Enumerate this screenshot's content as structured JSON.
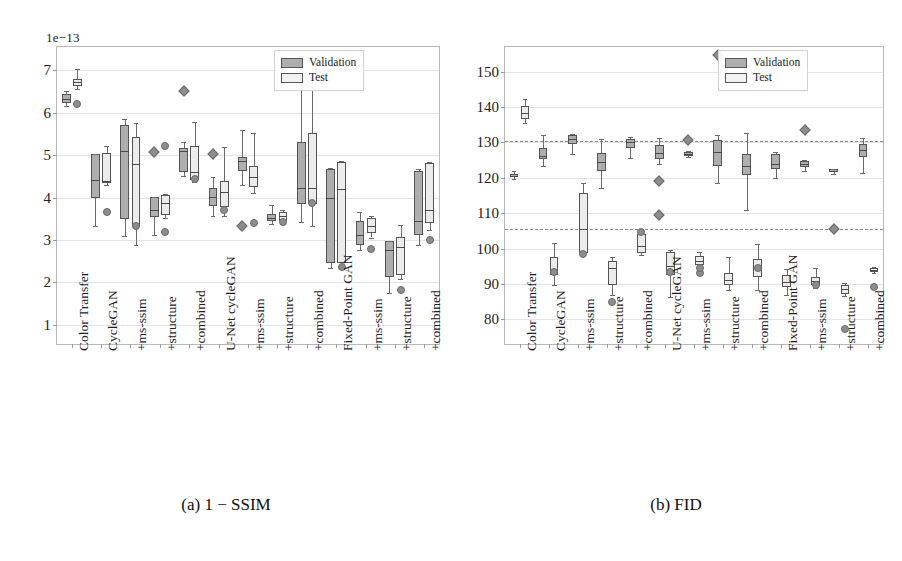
{
  "figure": {
    "panels": [
      {
        "id": "panel-a",
        "caption": "(a) 1 − SSIM",
        "exponent_label": "1e−13",
        "legend": {
          "validation": "Validation",
          "test": "Test"
        }
      },
      {
        "id": "panel-b",
        "caption": "(b) FID",
        "exponent_label": "",
        "legend": {
          "validation": "Validation",
          "test": "Test"
        }
      }
    ]
  },
  "chart_data": [
    {
      "type": "box",
      "title": "(a) 1 − SSIM",
      "xlabel": "",
      "ylabel": "",
      "ylim": [
        0.55,
        7.55
      ],
      "yticks": [
        1,
        2,
        3,
        4,
        5,
        6,
        7
      ],
      "exponent": "1e−13",
      "grid": true,
      "legend_position": "top-right",
      "legend": [
        "Validation",
        "Test"
      ],
      "categories": [
        "Color Transfer",
        "CycleGAN",
        "+ms-ssim",
        "+structure",
        "+combined",
        "U-Net cycleGAN",
        "+ms-ssim",
        "+structure",
        "+combined",
        "Fixed-Point GAN",
        "+ms-ssim",
        "+structure",
        "+combined"
      ],
      "series": [
        {
          "name": "Validation",
          "color": "#aeaeae",
          "boxes": [
            {
              "whislo": 6.16,
              "q1": 6.24,
              "med": 6.32,
              "q3": 6.45,
              "whishi": 6.52,
              "fliers": []
            },
            {
              "whislo": 3.33,
              "q1": 4.0,
              "med": 4.42,
              "q3": 5.03,
              "whishi": 5.03,
              "fliers": []
            },
            {
              "whislo": 3.1,
              "q1": 3.5,
              "med": 5.1,
              "q3": 5.7,
              "whishi": 5.86,
              "fliers": []
            },
            {
              "whislo": 3.13,
              "q1": 3.55,
              "med": 3.72,
              "q3": 4.02,
              "whishi": 4.02,
              "fliers": [
                5.08
              ]
            },
            {
              "whislo": 4.52,
              "q1": 4.6,
              "med": 5.1,
              "q3": 5.18,
              "whishi": 5.3,
              "fliers": [
                6.52
              ]
            },
            {
              "whislo": 3.56,
              "q1": 3.8,
              "med": 4.02,
              "q3": 4.22,
              "whishi": 4.48,
              "fliers": [
                5.02
              ]
            },
            {
              "whislo": 4.3,
              "q1": 4.62,
              "med": 4.86,
              "q3": 4.96,
              "whishi": 5.6,
              "fliers": [
                3.34
              ]
            },
            {
              "whislo": 3.37,
              "q1": 3.44,
              "med": 3.52,
              "q3": 3.62,
              "whishi": 3.82,
              "fliers": []
            },
            {
              "whislo": 3.42,
              "q1": 3.86,
              "med": 4.22,
              "q3": 5.3,
              "whishi": 7.34,
              "fliers": []
            },
            {
              "whislo": 2.34,
              "q1": 2.46,
              "med": 4.0,
              "q3": 4.68,
              "whishi": 4.7,
              "fliers": []
            },
            {
              "whislo": 2.76,
              "q1": 2.88,
              "med": 3.12,
              "q3": 3.46,
              "whishi": 3.66,
              "fliers": []
            },
            {
              "whislo": 1.76,
              "q1": 2.14,
              "med": 2.76,
              "q3": 2.98,
              "whishi": 2.98,
              "fliers": []
            },
            {
              "whislo": 2.88,
              "q1": 3.12,
              "med": 3.46,
              "q3": 4.62,
              "whishi": 4.68,
              "fliers": []
            }
          ]
        },
        {
          "name": "Test",
          "color": "#ececec",
          "boxes": [
            {
              "whislo": 6.56,
              "q1": 6.62,
              "med": 6.72,
              "q3": 6.8,
              "whishi": 7.04,
              "fliers": [
                6.2
              ]
            },
            {
              "whislo": 4.3,
              "q1": 4.34,
              "med": 4.38,
              "q3": 5.04,
              "whishi": 5.22,
              "fliers": [
                3.66
              ]
            },
            {
              "whislo": 2.88,
              "q1": 3.3,
              "med": 4.8,
              "q3": 5.44,
              "whishi": 5.76,
              "fliers": [
                3.32
              ]
            },
            {
              "whislo": 3.52,
              "q1": 3.6,
              "med": 3.88,
              "q3": 4.06,
              "whishi": 4.08,
              "fliers": [
                3.19,
                5.21
              ]
            },
            {
              "whislo": 4.36,
              "q1": 4.42,
              "med": 4.6,
              "q3": 5.22,
              "whishi": 5.78,
              "fliers": [
                4.43
              ]
            },
            {
              "whislo": 3.56,
              "q1": 3.78,
              "med": 4.14,
              "q3": 4.38,
              "whishi": 5.2,
              "fliers": [
                3.72
              ]
            },
            {
              "whislo": 4.1,
              "q1": 4.26,
              "med": 4.48,
              "q3": 4.74,
              "whishi": 5.52,
              "fliers": [
                3.41
              ]
            },
            {
              "whislo": 3.38,
              "q1": 3.46,
              "med": 3.56,
              "q3": 3.66,
              "whishi": 3.7,
              "fliers": [
                3.42
              ]
            },
            {
              "whislo": 3.34,
              "q1": 3.86,
              "med": 4.22,
              "q3": 5.52,
              "whishi": 6.82,
              "fliers": [
                3.88
              ]
            },
            {
              "whislo": 2.32,
              "q1": 2.46,
              "med": 4.2,
              "q3": 4.84,
              "whishi": 4.86,
              "fliers": [
                2.36
              ]
            },
            {
              "whislo": 3.06,
              "q1": 3.16,
              "med": 3.34,
              "q3": 3.52,
              "whishi": 3.56,
              "fliers": [
                2.8
              ]
            },
            {
              "whislo": 2.08,
              "q1": 2.18,
              "med": 2.84,
              "q3": 3.08,
              "whishi": 3.36,
              "fliers": [
                1.82
              ]
            },
            {
              "whislo": 3.24,
              "q1": 3.4,
              "med": 3.7,
              "q3": 4.82,
              "whishi": 4.84,
              "fliers": [
                3.0
              ]
            }
          ]
        }
      ]
    },
    {
      "type": "box",
      "title": "(b) FID",
      "xlabel": "",
      "ylabel": "",
      "ylim": [
        73,
        157
      ],
      "yticks": [
        80,
        90,
        100,
        110,
        120,
        130,
        140,
        150
      ],
      "grid": true,
      "reference_lines": [
        130.5,
        105.5
      ],
      "legend_position": "top-right",
      "legend": [
        "Validation",
        "Test"
      ],
      "categories": [
        "Color Transfer",
        "CycleGAN",
        "+ms-ssim",
        "+structure",
        "+combined",
        "U-Net cycleGAN",
        "+ms-ssim",
        "+structure",
        "+combined",
        "Fixed-Point GAN",
        "+ms-ssim",
        "+structure",
        "+combined"
      ],
      "series": [
        {
          "name": "Validation",
          "color": "#aeaeae",
          "boxes": [
            {
              "whislo": 119.6,
              "q1": 120.2,
              "med": 120.6,
              "q3": 121.2,
              "whishi": 121.8,
              "fliers": []
            },
            {
              "whislo": 123.4,
              "q1": 125.3,
              "med": 126.3,
              "q3": 128.4,
              "whishi": 132.0,
              "fliers": []
            },
            {
              "whislo": 126.8,
              "q1": 129.6,
              "med": 131.0,
              "q3": 132.2,
              "whishi": 132.4,
              "fliers": []
            },
            {
              "whislo": 117.2,
              "q1": 122.0,
              "med": 124.6,
              "q3": 127.0,
              "whishi": 131.0,
              "fliers": []
            },
            {
              "whislo": 125.6,
              "q1": 128.4,
              "med": 130.2,
              "q3": 131.0,
              "whishi": 131.6,
              "fliers": []
            },
            {
              "whislo": 124.0,
              "q1": 125.4,
              "med": 127.0,
              "q3": 129.2,
              "whishi": 131.2,
              "fliers": [
                119.2,
                109.6
              ]
            },
            {
              "whislo": 125.8,
              "q1": 126.2,
              "med": 126.6,
              "q3": 127.4,
              "whishi": 127.6,
              "fliers": [
                130.6
              ]
            },
            {
              "whislo": 118.4,
              "q1": 123.4,
              "med": 127.2,
              "q3": 130.8,
              "whishi": 132.0,
              "fliers": [
                154.6
              ]
            },
            {
              "whislo": 110.8,
              "q1": 120.8,
              "med": 123.4,
              "q3": 126.6,
              "whishi": 132.6,
              "fliers": []
            },
            {
              "whislo": 120.0,
              "q1": 122.6,
              "med": 124.0,
              "q3": 126.8,
              "whishi": 127.4,
              "fliers": []
            },
            {
              "whislo": 122.0,
              "q1": 123.0,
              "med": 124.0,
              "q3": 124.8,
              "whishi": 125.0,
              "fliers": [
                133.4
              ]
            },
            {
              "whislo": 121.2,
              "q1": 121.6,
              "med": 122.0,
              "q3": 122.4,
              "whishi": 122.6,
              "fliers": [
                105.4
              ]
            },
            {
              "whislo": 121.4,
              "q1": 125.8,
              "med": 128.0,
              "q3": 129.6,
              "whishi": 131.2,
              "fliers": []
            }
          ]
        },
        {
          "name": "Test",
          "color": "#ececec",
          "boxes": [
            {
              "whislo": 135.6,
              "q1": 136.6,
              "med": 138.4,
              "q3": 140.4,
              "whishi": 142.4,
              "fliers": []
            },
            {
              "whislo": 89.8,
              "q1": 92.6,
              "med": 94.0,
              "q3": 97.6,
              "whishi": 101.6,
              "fliers": [
                93.4
              ]
            },
            {
              "whislo": 98.2,
              "q1": 98.8,
              "med": 105.6,
              "q3": 115.6,
              "whishi": 118.6,
              "fliers": [
                98.4
              ]
            },
            {
              "whislo": 86.8,
              "q1": 89.8,
              "med": 94.4,
              "q3": 96.6,
              "whishi": 97.6,
              "fliers": [
                84.8
              ]
            },
            {
              "whislo": 98.2,
              "q1": 98.8,
              "med": 100.6,
              "q3": 104.2,
              "whishi": 104.6,
              "fliers": [
                104.8
              ]
            },
            {
              "whislo": 86.4,
              "q1": 92.6,
              "med": 95.2,
              "q3": 99.0,
              "whishi": 99.6,
              "fliers": [
                93.4
              ]
            },
            {
              "whislo": 92.4,
              "q1": 95.4,
              "med": 96.6,
              "q3": 98.0,
              "whishi": 99.0,
              "fliers": [
                93.2,
                94.6
              ]
            },
            {
              "whislo": 88.4,
              "q1": 89.6,
              "med": 91.2,
              "q3": 93.2,
              "whishi": 97.6,
              "fliers": []
            },
            {
              "whislo": 88.4,
              "q1": 92.0,
              "med": 94.6,
              "q3": 97.0,
              "whishi": 101.4,
              "fliers": [
                94.6
              ]
            },
            {
              "whislo": 86.8,
              "q1": 89.2,
              "med": 90.4,
              "q3": 92.6,
              "whishi": 94.2,
              "fliers": []
            },
            {
              "whislo": 88.8,
              "q1": 89.6,
              "med": 90.8,
              "q3": 92.0,
              "whishi": 94.4,
              "fliers": [
                89.6
              ]
            },
            {
              "whislo": 86.6,
              "q1": 87.2,
              "med": 88.6,
              "q3": 89.8,
              "whishi": 90.2,
              "fliers": [
                77.2
              ]
            },
            {
              "whislo": 93.2,
              "q1": 93.4,
              "med": 93.8,
              "q3": 94.6,
              "whishi": 94.8,
              "fliers": [
                89.0
              ]
            }
          ]
        }
      ]
    }
  ]
}
